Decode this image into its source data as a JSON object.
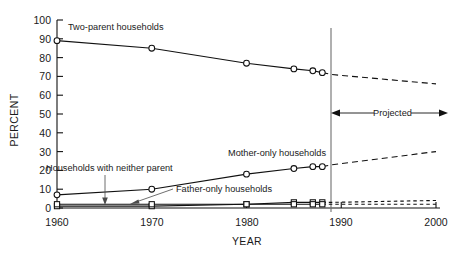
{
  "chart_data": {
    "type": "line",
    "title": "",
    "xlabel": "YEAR",
    "ylabel": "PERCENT",
    "xlim": [
      1960,
      2000
    ],
    "ylim": [
      0,
      100
    ],
    "xticks": [
      "1960",
      "1970",
      "1980",
      "1990",
      "2000"
    ],
    "yticks": [
      "0",
      "10",
      "20",
      "30",
      "40",
      "50",
      "60",
      "70",
      "80",
      "90",
      "100"
    ],
    "grid": false,
    "legend": "inline-annotations",
    "projection_start_year": 1989,
    "annotations": [
      {
        "text": "Two-parent households",
        "x": 1963,
        "y": 94
      },
      {
        "text": "Mother-only households",
        "x": 1981,
        "y": 27
      },
      {
        "text": "Households with neither parent",
        "x": 1962,
        "y": 20
      },
      {
        "text": "Father-only households",
        "x": 1973,
        "y": 8
      },
      {
        "text": "Projected",
        "x": 1994,
        "y": 46
      }
    ],
    "series": [
      {
        "name": "Two-parent households",
        "observed_x": [
          1960,
          1970,
          1980,
          1985,
          1987,
          1988
        ],
        "observed_values": [
          89,
          85,
          77,
          74,
          73,
          72
        ],
        "projected_x": [
          1989,
          2000
        ],
        "projected_values": [
          71,
          66
        ]
      },
      {
        "name": "Mother-only households",
        "observed_x": [
          1960,
          1970,
          1980,
          1985,
          1987,
          1988
        ],
        "observed_values": [
          7,
          10,
          18,
          21,
          22,
          22
        ],
        "projected_x": [
          1989,
          2000
        ],
        "projected_values": [
          23,
          30
        ]
      },
      {
        "name": "Father-only households",
        "observed_x": [
          1960,
          1970,
          1980,
          1985,
          1987,
          1988
        ],
        "observed_values": [
          1,
          1,
          2,
          3,
          3,
          3
        ],
        "projected_x": [
          1989,
          2000
        ],
        "projected_values": [
          3,
          4
        ]
      },
      {
        "name": "Households with neither parent",
        "observed_x": [
          1960,
          1970,
          1980,
          1985,
          1987,
          1988
        ],
        "observed_values": [
          2,
          2,
          2,
          2,
          2,
          2
        ],
        "projected_x": [
          1989,
          2000
        ],
        "projected_values": [
          2,
          2
        ]
      }
    ]
  },
  "axes": {
    "y_title": "PERCENT",
    "x_title": "YEAR",
    "y_tick_0": "0",
    "y_tick_10": "10",
    "y_tick_20": "20",
    "y_tick_30": "30",
    "y_tick_40": "40",
    "y_tick_50": "50",
    "y_tick_60": "60",
    "y_tick_70": "70",
    "y_tick_80": "80",
    "y_tick_90": "90",
    "y_tick_100": "100",
    "x_tick_1960": "1960",
    "x_tick_1970": "1970",
    "x_tick_1980": "1980",
    "x_tick_1990": "1990",
    "x_tick_2000": "2000"
  },
  "labels": {
    "two_parent": "Two-parent households",
    "mother_only": "Mother-only households",
    "neither_parent": "Households with neither parent",
    "father_only": "Father-only households",
    "projected": "Projected"
  },
  "colors": {
    "ink": "#111111",
    "divider": "#6f6f6f",
    "background": "#ffffff"
  }
}
